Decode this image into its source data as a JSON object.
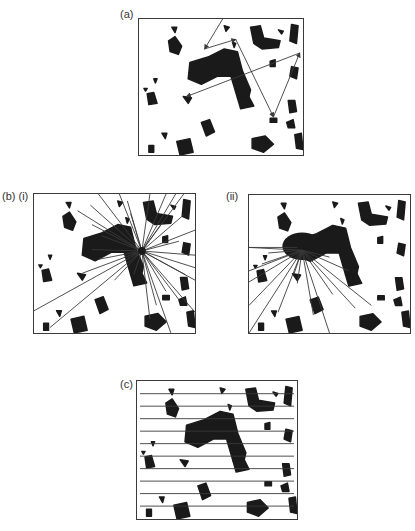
{
  "figure": {
    "labels": {
      "a": "(a)",
      "b_i": "(b) (i)",
      "b_ii": "(ii)",
      "c": "(c)"
    },
    "colors": {
      "ink": "#1a1a1a",
      "line": "#3a3a3a",
      "background": "#ffffff"
    },
    "panels": [
      {
        "id": "a",
        "description": "Random-walk sampling: sequence of arrows between points",
        "box": [
          138,
          18,
          166,
          138
        ]
      },
      {
        "id": "b_i",
        "description": "Radial lines from a point in the pore space",
        "box": [
          33,
          193,
          163,
          141
        ]
      },
      {
        "id": "b_ii",
        "description": "Radial lines from a point inside a large cluster",
        "box": [
          248,
          194,
          163,
          140
        ]
      },
      {
        "id": "c",
        "description": "Parallel horizontal line transects",
        "box": [
          136,
          380,
          162,
          140
        ]
      }
    ],
    "clusters": [
      [
        [
          0.42,
          0.28
        ],
        [
          0.52,
          0.22
        ],
        [
          0.6,
          0.24
        ],
        [
          0.63,
          0.38
        ],
        [
          0.68,
          0.52
        ],
        [
          0.66,
          0.62
        ],
        [
          0.6,
          0.58
        ],
        [
          0.56,
          0.42
        ],
        [
          0.48,
          0.42
        ],
        [
          0.38,
          0.48
        ],
        [
          0.3,
          0.44
        ],
        [
          0.31,
          0.32
        ]
      ],
      [
        [
          0.68,
          0.06
        ],
        [
          0.74,
          0.05
        ],
        [
          0.76,
          0.14
        ],
        [
          0.86,
          0.16
        ],
        [
          0.85,
          0.21
        ],
        [
          0.75,
          0.22
        ],
        [
          0.7,
          0.18
        ]
      ],
      [
        [
          0.18,
          0.16
        ],
        [
          0.22,
          0.13
        ],
        [
          0.26,
          0.2
        ],
        [
          0.24,
          0.26
        ],
        [
          0.19,
          0.24
        ]
      ],
      [
        [
          0.93,
          0.04
        ],
        [
          0.97,
          0.05
        ],
        [
          0.96,
          0.18
        ],
        [
          0.92,
          0.16
        ]
      ],
      [
        [
          0.93,
          0.35
        ],
        [
          0.97,
          0.36
        ],
        [
          0.96,
          0.44
        ],
        [
          0.92,
          0.42
        ]
      ],
      [
        [
          0.6,
          0.58
        ],
        [
          0.67,
          0.57
        ],
        [
          0.7,
          0.64
        ],
        [
          0.62,
          0.66
        ]
      ],
      [
        [
          0.05,
          0.55
        ],
        [
          0.09,
          0.54
        ],
        [
          0.11,
          0.62
        ],
        [
          0.06,
          0.63
        ]
      ],
      [
        [
          0.91,
          0.6
        ],
        [
          0.95,
          0.6
        ],
        [
          0.96,
          0.68
        ],
        [
          0.92,
          0.69
        ]
      ],
      [
        [
          0.38,
          0.76
        ],
        [
          0.43,
          0.74
        ],
        [
          0.46,
          0.83
        ],
        [
          0.41,
          0.86
        ]
      ],
      [
        [
          0.69,
          0.88
        ],
        [
          0.77,
          0.86
        ],
        [
          0.82,
          0.92
        ],
        [
          0.76,
          0.98
        ],
        [
          0.69,
          0.95
        ]
      ],
      [
        [
          0.23,
          0.9
        ],
        [
          0.31,
          0.88
        ],
        [
          0.33,
          0.98
        ],
        [
          0.25,
          1.0
        ]
      ],
      [
        [
          0.95,
          0.85
        ],
        [
          0.99,
          0.84
        ],
        [
          1.0,
          0.96
        ],
        [
          0.96,
          0.95
        ]
      ],
      [
        [
          0.9,
          0.76
        ],
        [
          0.94,
          0.74
        ],
        [
          0.95,
          0.8
        ],
        [
          0.91,
          0.8
        ]
      ],
      [
        [
          0.27,
          0.57
        ],
        [
          0.32,
          0.58
        ],
        [
          0.3,
          0.62
        ]
      ],
      [
        [
          0.8,
          0.31
        ],
        [
          0.83,
          0.3
        ],
        [
          0.83,
          0.35
        ],
        [
          0.8,
          0.35
        ]
      ],
      [
        [
          0.06,
          0.93
        ],
        [
          0.09,
          0.93
        ],
        [
          0.09,
          0.98
        ],
        [
          0.06,
          0.98
        ]
      ],
      [
        [
          0.14,
          0.84
        ],
        [
          0.17,
          0.84
        ],
        [
          0.16,
          0.88
        ]
      ],
      [
        [
          0.85,
          0.08
        ],
        [
          0.88,
          0.09
        ],
        [
          0.87,
          0.11
        ]
      ],
      [
        [
          0.52,
          0.05
        ],
        [
          0.55,
          0.06
        ],
        [
          0.53,
          0.09
        ]
      ],
      [
        [
          0.8,
          0.73
        ],
        [
          0.84,
          0.73
        ],
        [
          0.84,
          0.76
        ],
        [
          0.8,
          0.76
        ]
      ],
      [
        [
          0.57,
          0.17
        ],
        [
          0.59,
          0.18
        ],
        [
          0.58,
          0.21
        ]
      ],
      [
        [
          0.09,
          0.44
        ],
        [
          0.11,
          0.44
        ],
        [
          0.1,
          0.47
        ]
      ],
      [
        [
          0.03,
          0.51
        ],
        [
          0.05,
          0.51
        ],
        [
          0.04,
          0.53
        ]
      ],
      [
        [
          0.2,
          0.06
        ],
        [
          0.23,
          0.06
        ],
        [
          0.22,
          0.1
        ]
      ]
    ],
    "panel_a_arrows": [
      [
        [
          0.51,
          0.0
        ],
        [
          0.4,
          0.22
        ]
      ],
      [
        [
          0.4,
          0.22
        ],
        [
          0.59,
          0.15
        ]
      ],
      [
        [
          0.59,
          0.15
        ],
        [
          0.82,
          0.72
        ]
      ],
      [
        [
          0.82,
          0.72
        ],
        [
          0.98,
          0.25
        ]
      ],
      [
        [
          0.98,
          0.25
        ],
        [
          0.29,
          0.57
        ]
      ]
    ],
    "panel_b_i": {
      "center": [
        0.67,
        0.41
      ],
      "endpoints": [
        [
          0.4,
          0.0
        ],
        [
          0.53,
          0.0
        ],
        [
          0.72,
          0.0
        ],
        [
          0.82,
          0.0
        ],
        [
          0.88,
          0.0
        ],
        [
          0.93,
          0.0
        ],
        [
          0.27,
          0.12
        ],
        [
          0.35,
          0.08
        ],
        [
          0.6,
          0.14
        ],
        [
          0.8,
          0.2
        ],
        [
          0.93,
          0.15
        ],
        [
          1.0,
          0.26
        ],
        [
          0.36,
          0.22
        ],
        [
          0.42,
          0.3
        ],
        [
          0.36,
          0.4
        ],
        [
          0.4,
          0.47
        ],
        [
          0.3,
          0.57
        ],
        [
          0.0,
          0.84
        ],
        [
          0.1,
          0.96
        ],
        [
          0.5,
          0.62
        ],
        [
          0.62,
          0.58
        ],
        [
          0.72,
          0.9
        ],
        [
          0.85,
          1.0
        ],
        [
          0.76,
          0.8
        ],
        [
          0.82,
          0.7
        ],
        [
          0.9,
          0.76
        ],
        [
          1.0,
          0.85
        ],
        [
          0.94,
          0.58
        ],
        [
          1.0,
          0.62
        ],
        [
          1.0,
          0.53
        ],
        [
          0.9,
          0.34
        ],
        [
          1.0,
          0.44
        ],
        [
          0.58,
          0.05
        ]
      ]
    },
    "panel_b_ii": {
      "center": [
        0.33,
        0.4
      ],
      "endpoints": [
        [
          0.0,
          0.38
        ],
        [
          0.12,
          0.42
        ],
        [
          0.0,
          0.55
        ],
        [
          0.08,
          0.5
        ],
        [
          0.0,
          0.63
        ],
        [
          0.0,
          0.8
        ],
        [
          0.0,
          1.0
        ],
        [
          0.18,
          0.85
        ],
        [
          0.28,
          0.57
        ],
        [
          0.3,
          0.64
        ],
        [
          0.4,
          0.87
        ],
        [
          0.5,
          1.0
        ],
        [
          0.52,
          0.72
        ],
        [
          0.66,
          0.82
        ],
        [
          0.76,
          0.8
        ],
        [
          0.62,
          0.55
        ],
        [
          0.5,
          0.45
        ]
      ],
      "horizontal_line": [
        [
          0.0,
          0.38
        ],
        [
          0.3,
          0.38
        ]
      ]
    },
    "panel_c": {
      "line_count": 10,
      "first_offset": 0.092,
      "spacing": 0.0905
    }
  }
}
